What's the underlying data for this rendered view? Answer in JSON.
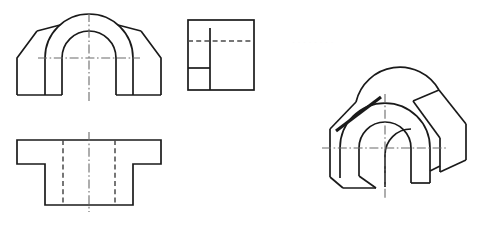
{
  "sheet": {
    "title": "Orthographic multiview engineering drawing with isometric pictorial",
    "background_color": "#ffffff",
    "visible_line_color": "#1a1a1a",
    "hidden_line_color": "#4a4a4a",
    "center_line_color": "#6b6b6b",
    "width": 485,
    "height": 227
  },
  "views": [
    {
      "id": "front-view",
      "label": "Front View",
      "description": "Arch-shaped block with chamfered shoulders and semicircular through slot",
      "position": {
        "x": 16,
        "y": 14,
        "width": 146,
        "height": 82
      }
    },
    {
      "id": "side-view",
      "label": "Side View",
      "description": "Square outline with internal vertical edge, horizontal rib line and horizontal hidden centerline",
      "position": {
        "x": 188,
        "y": 20,
        "width": 66,
        "height": 70
      }
    },
    {
      "id": "top-view",
      "label": "Top View",
      "description": "T-shaped outline with hidden lines showing the slot walls",
      "position": {
        "x": 16,
        "y": 140,
        "width": 146,
        "height": 66
      }
    },
    {
      "id": "isometric-view",
      "label": "Isometric Pictorial View",
      "description": "Three-dimensional pictorial of the arched block with chamfered wings and semicircular bore",
      "position": {
        "x": 320,
        "y": 88,
        "width": 155,
        "height": 103
      }
    }
  ],
  "geometry": {
    "front_view": {
      "base_left_x": 17,
      "base_right_x": 161,
      "base_y": 95,
      "shoulder_y": 58,
      "chamfer_top_x_left": 37,
      "chamfer_top_x_right": 141,
      "outer_arc_radius": 44,
      "inner_arc_radius": 27,
      "arc_center_x": 89,
      "arc_center_y": 58,
      "slot_left_x": 62,
      "slot_right_x": 116,
      "leg_inner_left_x": 45,
      "leg_inner_right_x": 133
    },
    "side_view": {
      "left_x": 188,
      "right_x": 254,
      "top_y": 20,
      "bottom_y": 90,
      "inner_vertical_x": 210,
      "rib_y": 68,
      "hidden_center_y": 41
    },
    "top_view": {
      "outer_left_x": 17,
      "outer_right_x": 161,
      "flange_top_y": 140,
      "flange_bottom_y": 164,
      "stem_left_x": 45,
      "stem_right_x": 133,
      "stem_bottom_y": 205,
      "hidden_line_x_left": 63,
      "hidden_line_x_right": 115
    },
    "isometric_view": {
      "arc_center_x": 385,
      "arc_center_y": 133,
      "outer_radius": 45,
      "inner_radius": 26,
      "depth_dx": 26,
      "depth_dy": -15
    }
  },
  "annotations": {
    "center_lines_present": true,
    "hidden_lines_present": true,
    "dimensions_present": false,
    "text_labels_present": false
  }
}
